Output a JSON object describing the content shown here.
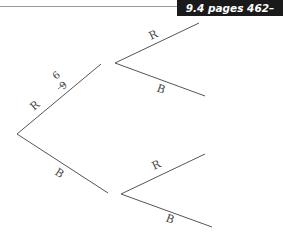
{
  "header": {
    "section_ref": "9.4 pages 462–468"
  },
  "tree": {
    "first_stage": [
      {
        "label": "R",
        "probability_numerator": "6",
        "probability_denominator": "9"
      },
      {
        "label": "B"
      }
    ],
    "second_stage_after_R": [
      {
        "label": "R"
      },
      {
        "label": "B"
      }
    ],
    "second_stage_after_B": [
      {
        "label": "R"
      },
      {
        "label": "B"
      }
    ]
  }
}
